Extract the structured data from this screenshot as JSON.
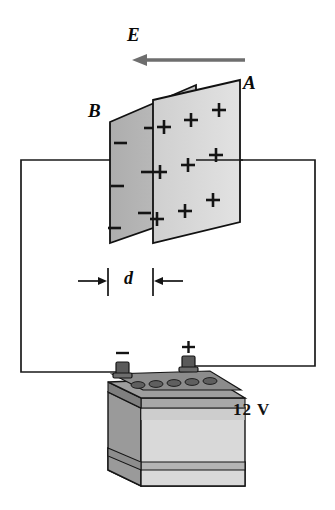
{
  "figure": {
    "labels": {
      "field_label": "E",
      "plate_front_label": "A",
      "plate_back_label": "B",
      "separation_label": "d",
      "battery_voltage": "12 V",
      "terminal_negative": "−",
      "terminal_positive": "+"
    },
    "field_arrow": {
      "direction": "left",
      "x_start": 245,
      "x_end": 133,
      "y": 60,
      "color": "#6e6e6e"
    },
    "plate_A": {
      "name": "positive-plate",
      "charge_symbol": "+",
      "fill": "#d8d8d8",
      "stroke": "#111111",
      "points": "153,100 240,80 240,222 153,243",
      "charges": [
        {
          "x": 164,
          "y": 127
        },
        {
          "x": 160,
          "y": 172
        },
        {
          "x": 157,
          "y": 219
        },
        {
          "x": 191,
          "y": 120
        },
        {
          "x": 188,
          "y": 165
        },
        {
          "x": 185,
          "y": 211
        },
        {
          "x": 219,
          "y": 110
        },
        {
          "x": 216,
          "y": 155
        },
        {
          "x": 213,
          "y": 200
        }
      ]
    },
    "plate_B": {
      "name": "negative-plate",
      "charge_symbol": "−",
      "fill": "#b6b6b6",
      "stroke": "#111111",
      "points": "110,122 196,85 196,213 110,243",
      "charges": [
        {
          "x": 120,
          "y": 143
        },
        {
          "x": 117,
          "y": 186
        },
        {
          "x": 114,
          "y": 228
        },
        {
          "x": 150,
          "y": 128
        },
        {
          "x": 147,
          "y": 172
        },
        {
          "x": 144,
          "y": 213
        },
        {
          "x": 178,
          "y": 108
        }
      ]
    },
    "separation_dimension": {
      "name": "plate-gap",
      "tick_left_x": 108,
      "tick_right_x": 153,
      "y": 281,
      "tick_half_height": 13
    },
    "circuit": {
      "wire_color": "#1a1a1a",
      "left_branch": "110,160 21,160 21,372 120,372",
      "right_branch": "196,160 315,160 315,366 190,366",
      "plate_stub_left": "21,160 110,160",
      "plate_stub_right": "190,160 240,160"
    },
    "battery": {
      "name": "car-battery-12v",
      "body_front_fill": "#d5d5d5",
      "body_side_fill": "#9a9a9a",
      "body_top_fill": "#8d8d8d",
      "band_fill": "#bdbdbd",
      "terminal_fill": "#5a5a5a",
      "outline": "#151515",
      "negative_post_x": 122,
      "positive_post_x": 188,
      "post_y": 368
    }
  }
}
